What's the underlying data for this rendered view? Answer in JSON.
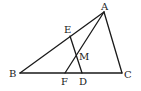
{
  "figure": {
    "type": "triangle-diagram",
    "points": {
      "A": {
        "label": "A",
        "x": 104,
        "y": 12,
        "lx": 101,
        "ly": 10
      },
      "B": {
        "label": "B",
        "x": 20,
        "y": 73,
        "lx": 9,
        "ly": 77
      },
      "C": {
        "label": "C",
        "x": 122,
        "y": 73,
        "lx": 124,
        "ly": 78
      },
      "E": {
        "label": "E",
        "x": 70,
        "y": 36,
        "lx": 64,
        "ly": 33
      },
      "M": {
        "label": "M",
        "x": 77,
        "y": 56,
        "lx": 79,
        "ly": 60
      },
      "F": {
        "label": "F",
        "x": 65,
        "y": 73,
        "lx": 61,
        "ly": 85
      },
      "D": {
        "label": "D",
        "x": 82,
        "y": 73,
        "lx": 79,
        "ly": 85
      }
    },
    "segments": [
      {
        "from": "A",
        "to": "B"
      },
      {
        "from": "B",
        "to": "C"
      },
      {
        "from": "C",
        "to": "A"
      },
      {
        "from": "A",
        "to": "F"
      },
      {
        "from": "E",
        "to": "D"
      }
    ],
    "labels": [
      "A",
      "B",
      "C",
      "E",
      "M",
      "F",
      "D"
    ]
  }
}
